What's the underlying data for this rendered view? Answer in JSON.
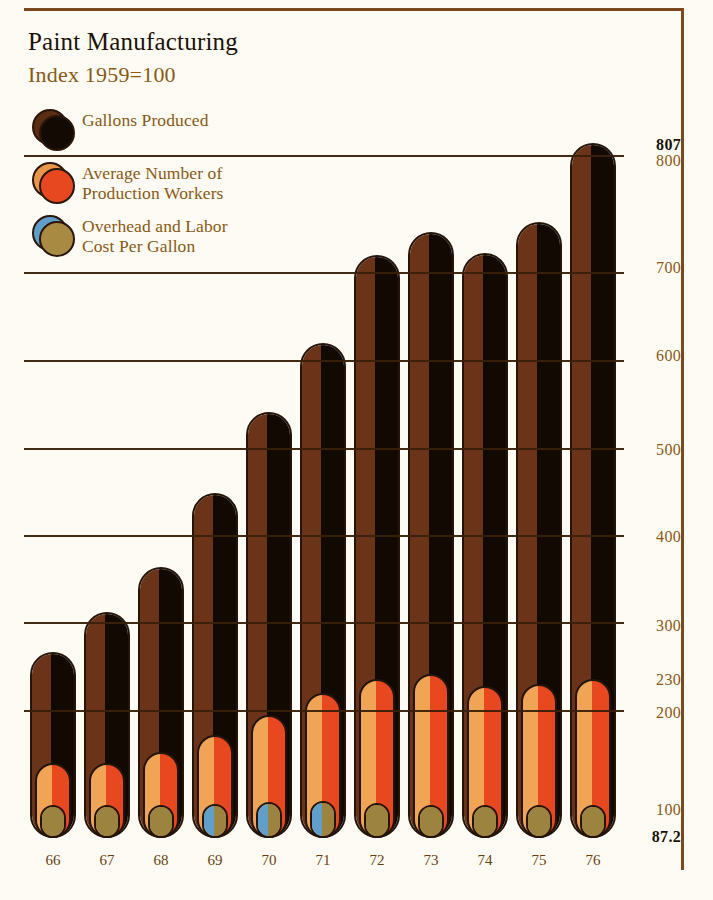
{
  "header": {
    "title": "Paint Manufacturing",
    "subtitle": "Index 1959=100"
  },
  "legend": {
    "items": [
      {
        "label": "Gallons Produced",
        "back_color": "#5a2d14",
        "front_color": "#140a04",
        "name": "gallons-produced"
      },
      {
        "label": "Average Number of\nProduction Workers",
        "back_color": "#e8964a",
        "front_color": "#e8481f",
        "name": "production-workers"
      },
      {
        "label": "Overhead and Labor\nCost Per Gallon",
        "back_color": "#5f9fc9",
        "front_color": "#a88a42",
        "name": "cost-per-gallon"
      }
    ]
  },
  "axis": {
    "ticks": [
      {
        "label": "807",
        "bold": true
      },
      {
        "label": "800",
        "bold": false
      },
      {
        "label": "700",
        "bold": false
      },
      {
        "label": "600",
        "bold": false
      },
      {
        "label": "500",
        "bold": false
      },
      {
        "label": "400",
        "bold": false
      },
      {
        "label": "300",
        "bold": false
      },
      {
        "label": "230",
        "bold": false
      },
      {
        "label": "200",
        "bold": false
      },
      {
        "label": "100",
        "bold": false
      },
      {
        "label": "87.2",
        "bold": true
      }
    ]
  },
  "chart_data": {
    "type": "bar",
    "title": "Paint Manufacturing",
    "subtitle": "Index 1959=100",
    "xlabel": "",
    "ylabel": "Index 1959=100",
    "ylim": [
      87.2,
      807
    ],
    "grid": true,
    "legend_position": "top-left",
    "categories": [
      "66",
      "67",
      "68",
      "69",
      "70",
      "71",
      "72",
      "73",
      "74",
      "75",
      "76"
    ],
    "series": [
      {
        "name": "Gallons Produced",
        "color": "#3a1d0c",
        "values": [
          215,
          252,
          292,
          358,
          430,
          505,
          600,
          620,
          600,
          650,
          807
        ]
      },
      {
        "name": "Average Number of Production Workers",
        "color": "#e8481f",
        "values": [
          140,
          140,
          152,
          172,
          192,
          215,
          230,
          235,
          222,
          225,
          230
        ]
      },
      {
        "name": "Overhead and Labor Cost Per Gallon",
        "color": "#a88a42",
        "values": [
          100,
          100,
          100,
          101,
          103,
          104,
          102,
          100,
          100,
          100,
          100
        ]
      }
    ],
    "annotations": [
      {
        "text": "807",
        "note": "top value of tallest bar, 1976"
      },
      {
        "text": "230",
        "note": "workers index gridline"
      },
      {
        "text": "87.2",
        "note": "baseline value"
      }
    ]
  },
  "bars": [
    {
      "year": "66",
      "gallons_top": 652,
      "workers_top": 763,
      "cost_top": 807,
      "has_blue": false
    },
    {
      "year": "67",
      "gallons_top": 612,
      "workers_top": 763,
      "cost_top": 807,
      "has_blue": false
    },
    {
      "year": "68",
      "gallons_top": 567,
      "workers_top": 752,
      "cost_top": 807,
      "has_blue": false
    },
    {
      "year": "69",
      "gallons_top": 493,
      "workers_top": 735,
      "cost_top": 806,
      "has_blue": true
    },
    {
      "year": "70",
      "gallons_top": 412,
      "workers_top": 715,
      "cost_top": 804,
      "has_blue": true
    },
    {
      "year": "71",
      "gallons_top": 343,
      "workers_top": 693,
      "cost_top": 803,
      "has_blue": true
    },
    {
      "year": "72",
      "gallons_top": 255,
      "workers_top": 679,
      "cost_top": 805,
      "has_blue": false
    },
    {
      "year": "73",
      "gallons_top": 232,
      "workers_top": 674,
      "cost_top": 807,
      "has_blue": false
    },
    {
      "year": "74",
      "gallons_top": 253,
      "workers_top": 686,
      "cost_top": 807,
      "has_blue": false
    },
    {
      "year": "75",
      "gallons_top": 222,
      "workers_top": 684,
      "cost_top": 807,
      "has_blue": false
    },
    {
      "year": "76",
      "gallons_top": 143,
      "workers_top": 679,
      "cost_top": 807,
      "has_blue": false
    }
  ],
  "geometry": {
    "baseline_y": 838,
    "bar_width": 46,
    "bar_gap": 8,
    "first_bar_x": 30,
    "inner_inset": 5,
    "cost_inset": 10,
    "gridlines": [
      {
        "value": 800,
        "y": 155
      },
      {
        "value": 700,
        "y": 272
      },
      {
        "value": 600,
        "y": 360
      },
      {
        "value": 500,
        "y": 448
      },
      {
        "value": 400,
        "y": 535
      },
      {
        "value": 300,
        "y": 622
      },
      {
        "value": 200,
        "y": 710
      }
    ]
  },
  "colors": {
    "page_bg": "#fdfbf3",
    "frame": "#7a4a1e",
    "title_text": "#1b1208",
    "accent_text": "#8a5a16",
    "outline": "#24150a",
    "gallons_light": "#6b3418",
    "gallons_dark": "#120902",
    "workers_light": "#f0a455",
    "workers_dark": "#e8481f",
    "cost_light": "#5f9fc9",
    "cost_dark": "#9c8340"
  },
  "axis_positions": [
    {
      "label": "807",
      "y": 136,
      "bold": true
    },
    {
      "label": "800",
      "y": 152,
      "bold": false
    },
    {
      "label": "700",
      "y": 259,
      "bold": false
    },
    {
      "label": "600",
      "y": 347,
      "bold": false
    },
    {
      "label": "500",
      "y": 441,
      "bold": false
    },
    {
      "label": "400",
      "y": 528,
      "bold": false
    },
    {
      "label": "300",
      "y": 617,
      "bold": false
    },
    {
      "label": "230",
      "y": 671,
      "bold": false
    },
    {
      "label": "200",
      "y": 704,
      "bold": false
    },
    {
      "label": "100",
      "y": 801,
      "bold": false
    },
    {
      "label": "87.2",
      "y": 828,
      "bold": true
    }
  ]
}
